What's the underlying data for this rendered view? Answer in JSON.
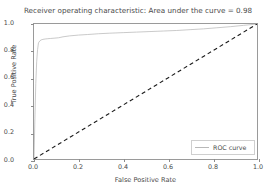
{
  "chart_data": {
    "type": "line",
    "title": "Receiver operating characteristic: Area under the curve = 0.98",
    "xlabel": "False Positive Rate",
    "ylabel": "True Positive Rate",
    "xlim": [
      0.0,
      1.0
    ],
    "ylim": [
      0.0,
      1.0
    ],
    "xticks": [
      "0.0",
      "0.2",
      "0.4",
      "0.6",
      "0.8",
      "1.0"
    ],
    "xtick_values": [
      0.0,
      0.2,
      0.4,
      0.6,
      0.8,
      1.0
    ],
    "yticks": [
      "0.0",
      "0.2",
      "0.4",
      "0.6",
      "0.8",
      "1.0"
    ],
    "ytick_values": [
      0.0,
      0.2,
      0.4,
      0.6,
      0.8,
      1.0
    ],
    "grid": false,
    "legend_position": "lower right",
    "auc": 0.98,
    "series": [
      {
        "name": "ROC curve",
        "color": "#b8b8b8",
        "style": "solid",
        "x": [
          0.0,
          0.004,
          0.008,
          0.012,
          0.016,
          0.02,
          0.026,
          0.032,
          0.04,
          0.05,
          0.062,
          0.075,
          0.09,
          0.11,
          0.13,
          0.16,
          0.2,
          0.24,
          0.29,
          0.34,
          0.4,
          0.46,
          0.52,
          0.58,
          0.64,
          0.7,
          0.76,
          0.82,
          0.88,
          0.94,
          1.0
        ],
        "y": [
          0.0,
          0.3,
          0.56,
          0.72,
          0.81,
          0.86,
          0.875,
          0.882,
          0.886,
          0.889,
          0.891,
          0.893,
          0.895,
          0.898,
          0.905,
          0.912,
          0.918,
          0.922,
          0.928,
          0.932,
          0.936,
          0.94,
          0.944,
          0.948,
          0.952,
          0.958,
          0.964,
          0.972,
          0.98,
          0.99,
          1.0
        ]
      },
      {
        "name": "chance-diagonal",
        "color": "#1a1a1a",
        "style": "dashed",
        "x": [
          0.0,
          1.0
        ],
        "y": [
          0.0,
          1.0
        ]
      }
    ]
  }
}
